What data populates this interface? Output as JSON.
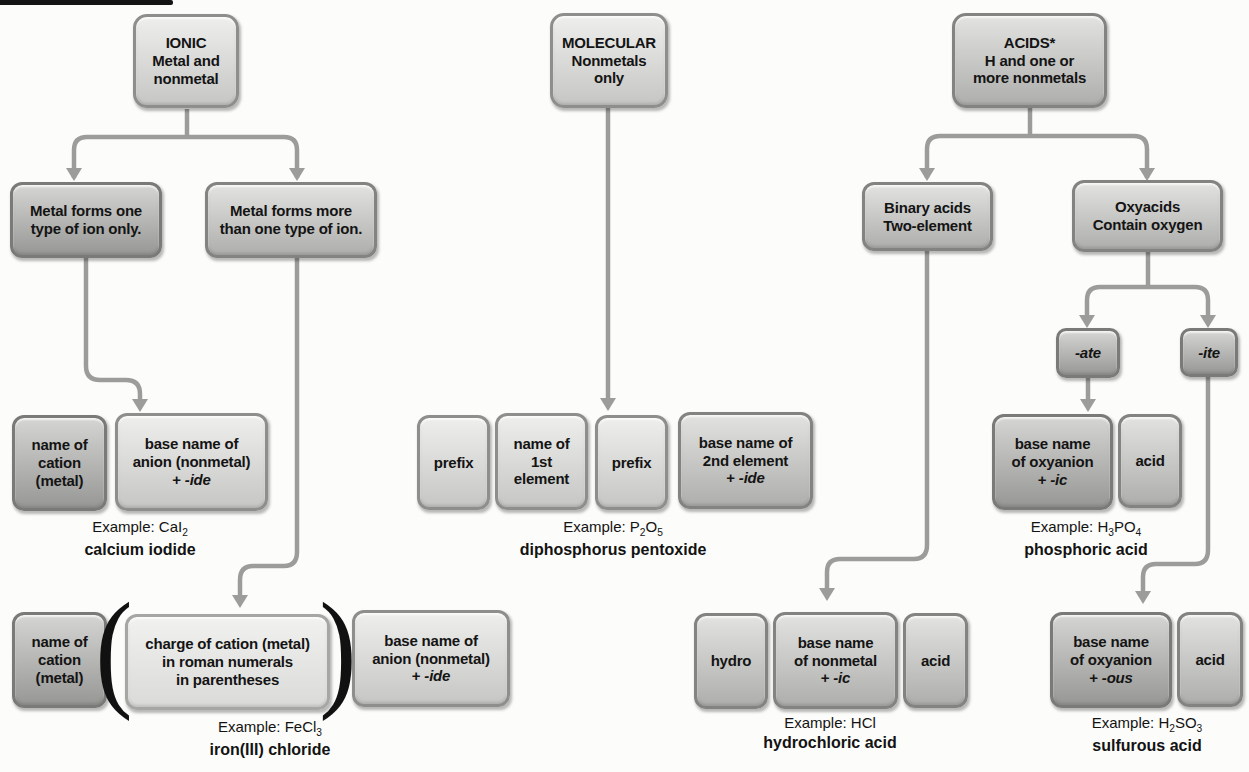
{
  "colors": {
    "line": "#9c9c9a",
    "text": "#141414",
    "page_bar": "#141414"
  },
  "ionic": {
    "root": {
      "l1": "IONIC",
      "l2": "Metal and",
      "l3": "nonmetal"
    },
    "one_type": {
      "l1": "Metal forms one",
      "l2": "type of ion only."
    },
    "more_type": {
      "l1": "Metal forms more",
      "l2": "than one type of ion."
    },
    "cation1": {
      "l1": "name of",
      "l2": "cation",
      "l3": "(metal)"
    },
    "anion1": {
      "l1": "base name of",
      "l2": "anion (nonmetal)",
      "plus": "+",
      "suffix": "-ide"
    },
    "example1": {
      "f1": "Example: CaI",
      "s1": "2",
      "name": "calcium iodide"
    },
    "cation2": {
      "l1": "name of",
      "l2": "cation",
      "l3": "(metal)"
    },
    "paren_open": "(",
    "charge": {
      "l1": "charge of cation (metal)",
      "l2": "in roman numerals",
      "l3": "in parentheses"
    },
    "paren_close": ")",
    "anion2": {
      "l1": "base name of",
      "l2": "anion (nonmetal)",
      "plus": "+",
      "suffix": "-ide"
    },
    "example2": {
      "f1": "Example: FeCl",
      "s1": "3",
      "name": "iron(III) chloride"
    }
  },
  "molecular": {
    "root": {
      "l1": "MOLECULAR",
      "l2": "Nonmetals",
      "l3": "only"
    },
    "prefix1": {
      "l1": "prefix"
    },
    "first": {
      "l1": "name of",
      "l2": "1st",
      "l3": "element"
    },
    "prefix2": {
      "l1": "prefix"
    },
    "second": {
      "l1": "base name of",
      "l2": "2nd element",
      "plus": "+",
      "suffix": "-ide"
    },
    "example": {
      "f1": "Example: P",
      "s1": "2",
      "f2": "O",
      "s2": "5",
      "name": "diphosphorus pentoxide"
    }
  },
  "acids": {
    "root": {
      "l1": "ACIDS*",
      "l2": "H and one or",
      "l3": "more nonmetals"
    },
    "binary": {
      "l1": "Binary acids",
      "l2": "Two-element"
    },
    "oxy": {
      "l1": "Oxyacids",
      "l2": "Contain oxygen"
    },
    "ate": {
      "suffix": "-ate"
    },
    "ite": {
      "suffix": "-ite"
    },
    "oxyanion_ic": {
      "l1": "base name",
      "l2": "of oxyanion",
      "plus": "+",
      "suffix": "-ic"
    },
    "acid1": {
      "l1": "acid"
    },
    "example_ic": {
      "f1": "Example: H",
      "s1": "3",
      "f2": "PO",
      "s2": "4",
      "name": "phosphoric acid"
    },
    "hydro": {
      "l1": "hydro"
    },
    "nonmetal_ic": {
      "l1": "base name",
      "l2": "of nonmetal",
      "plus": "+",
      "suffix": "-ic"
    },
    "acid2": {
      "l1": "acid"
    },
    "example_hcl": {
      "f1": "Example: HCl",
      "name": "hydrochloric acid"
    },
    "oxyanion_ous": {
      "l1": "base name",
      "l2": "of oxyanion",
      "plus": "+",
      "suffix": "-ous"
    },
    "acid3": {
      "l1": "acid"
    },
    "example_ous": {
      "f1": "Example: H",
      "s1": "2",
      "f2": "SO",
      "s2": "3",
      "name": "sulfurous acid"
    }
  }
}
